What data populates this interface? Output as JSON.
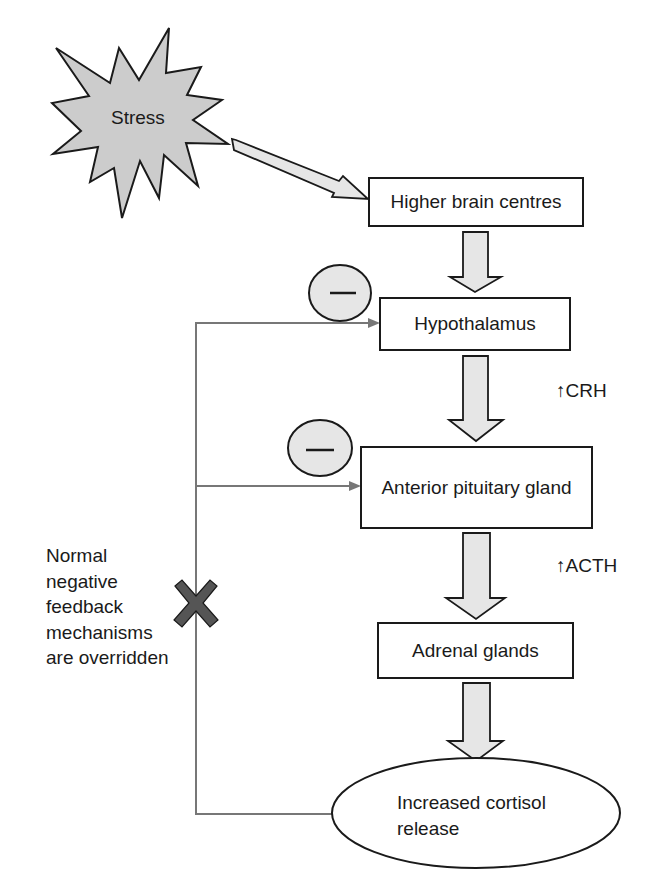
{
  "diagram": {
    "trigger": {
      "label": "Stress",
      "shape": "starburst",
      "fill": "#cccccc"
    },
    "nodes": [
      {
        "id": "higher-brain",
        "label": "Higher brain centres",
        "shape": "rectangle"
      },
      {
        "id": "hypothalamus",
        "label": "Hypothalamus",
        "shape": "rectangle"
      },
      {
        "id": "anterior-pituitary",
        "label": "Anterior pituitary gland",
        "shape": "rectangle"
      },
      {
        "id": "adrenal",
        "label": "Adrenal glands",
        "shape": "rectangle"
      },
      {
        "id": "cortisol",
        "label_line1": "Increased cortisol",
        "label_line2": "release",
        "shape": "ellipse"
      }
    ],
    "hormones": {
      "crh": "↑CRH",
      "acth": "↑ACTH"
    },
    "feedback": {
      "inhibit_symbol": "—",
      "note_lines": [
        "Normal",
        "negative",
        "feedback",
        "mechanisms",
        "are overridden"
      ],
      "blocked_icon": "x-mark"
    },
    "colors": {
      "arrow_fill": "#e6e6e6",
      "star_fill": "#cccccc",
      "line": "#777777",
      "x_mark": "#555555",
      "stroke": "#1a1a1a"
    }
  }
}
